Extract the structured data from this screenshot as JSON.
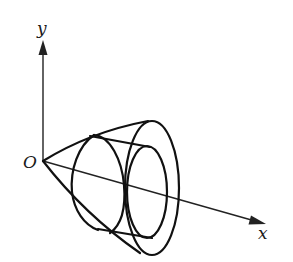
{
  "diagram": {
    "type": "3d-solid-of-revolution",
    "labels": {
      "y_axis": "y",
      "x_axis": "x",
      "origin": "O"
    },
    "colors": {
      "line": "#111111",
      "background": "#ffffff"
    },
    "elements": [
      {
        "name": "y-axis",
        "from": [
          43,
          161
        ],
        "to": [
          43,
          42
        ]
      },
      {
        "name": "x-axis",
        "from": [
          43,
          161
        ],
        "to": [
          264,
          224
        ]
      },
      {
        "name": "cone-outer-base-ellipse",
        "cx": 153,
        "cy": 188,
        "rx": 27,
        "ry": 67
      },
      {
        "name": "cylinder-front-ellipse",
        "cx": 98,
        "cy": 181,
        "rx": 28,
        "ry": 48
      },
      {
        "name": "cylinder-back-ellipse",
        "cx": 145,
        "cy": 192,
        "rx": 22,
        "ry": 46
      }
    ]
  }
}
